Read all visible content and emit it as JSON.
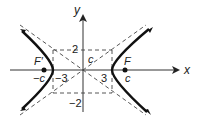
{
  "diagram": {
    "type": "hyperbola",
    "axes": {
      "x_label": "x",
      "y_label": "y"
    },
    "labels": {
      "y_top": "2",
      "y_bottom": "−2",
      "x_left": "−3",
      "x_right": "3",
      "c_box": "c",
      "focus_left": "F′",
      "focus_left_coord": "−c",
      "focus_right": "F",
      "focus_right_coord": "c"
    },
    "colors": {
      "curve": "#111111",
      "axis": "#333333",
      "dash": "#444444"
    }
  }
}
